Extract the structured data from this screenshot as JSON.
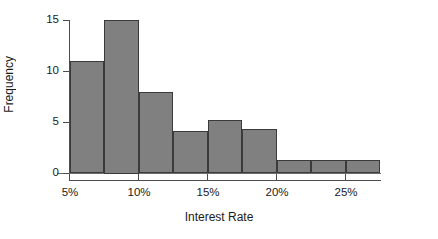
{
  "chart_data": {
    "type": "bar",
    "title": "",
    "subtitle": "",
    "xlabel": "Interest Rate",
    "ylabel": "Frequency",
    "grid": false,
    "legend": false,
    "legend_position": "none",
    "orientation": "vertical",
    "bin_width_percent": 2.5,
    "xlim": [
      5,
      27.5
    ],
    "ylim": [
      0,
      15
    ],
    "x_tick_labels": [
      "5%",
      "10%",
      "15%",
      "20%",
      "25%"
    ],
    "x_tick_values": [
      5,
      10,
      15,
      20,
      25
    ],
    "y_tick_labels": [
      "0",
      "5",
      "10",
      "15"
    ],
    "y_tick_values": [
      0,
      5,
      10,
      15
    ],
    "categories": [
      "5%-7.5%",
      "7.5%-10%",
      "10%-12.5%",
      "12.5%-15%",
      "15%-17.5%",
      "17.5%-20%",
      "20%-22.5%",
      "22.5%-25%",
      "25%-27.5%"
    ],
    "bin_edges": [
      5,
      7.5,
      10,
      12.5,
      15,
      17.5,
      20,
      22.5,
      25,
      27.5
    ],
    "values": [
      11,
      15,
      8,
      4.2,
      5.2,
      4.3,
      1.3,
      1.3,
      1.3
    ],
    "bar_fill_color": "#808080",
    "bar_edge_color": "#3a3a3a",
    "axis_color": "#4d4d4d",
    "text_color": "#1a1a1a",
    "background_color": "#ffffff"
  }
}
